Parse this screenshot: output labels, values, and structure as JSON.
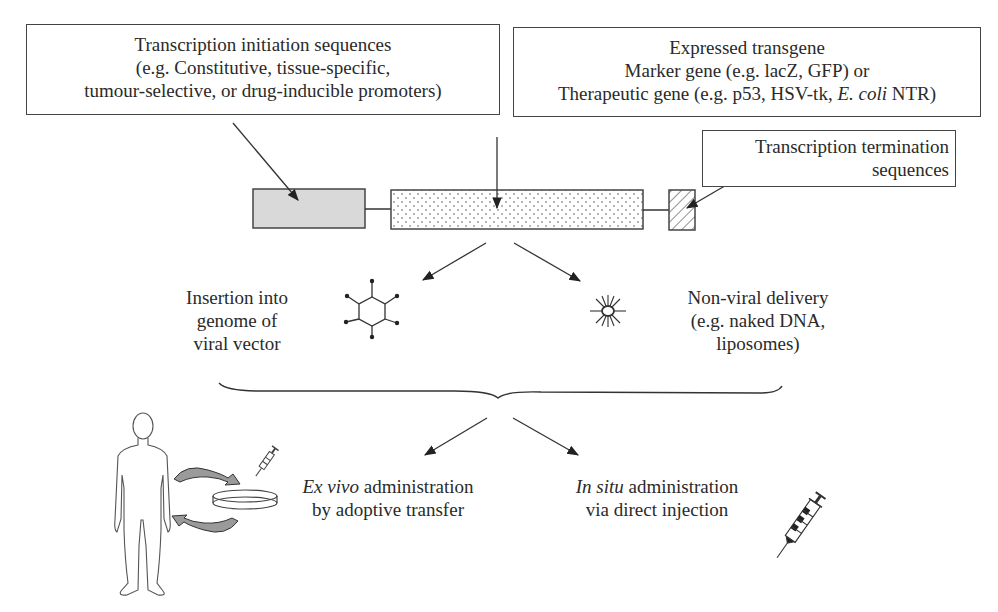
{
  "boxes": {
    "initiation": {
      "line1": "Transcription initiation sequences",
      "line2": "(e.g. Constitutive, tissue-specific,",
      "line3": "tumour-selective, or drug-inducible promoters)"
    },
    "transgene": {
      "line1": "Expressed transgene",
      "line2": "Marker gene (e.g. lacZ, GFP) or",
      "line3_pre": "Therapeutic gene (e.g. p53, HSV-tk, ",
      "line3_italic": "E. coli",
      "line3_post": " NTR)"
    },
    "termination": {
      "line1": "Transcription termination",
      "line2": "sequences"
    }
  },
  "delivery": {
    "viral": {
      "line1": "Insertion into",
      "line2": "genome of",
      "line3": "viral vector",
      "icon": "virus-hexagon-icon"
    },
    "nonviral": {
      "line1": "Non-viral delivery",
      "line2": "(e.g. naked DNA,",
      "line3": "liposomes)",
      "icon": "liposome-icon"
    }
  },
  "administration": {
    "ex_vivo": {
      "italic": "Ex vivo",
      "rest": " administration",
      "line2": "by adoptive transfer",
      "icons": [
        "human-figure-icon",
        "petri-dish-icon",
        "syringe-icon",
        "cycle-arrows-icon"
      ]
    },
    "in_situ": {
      "italic": "In situ",
      "rest": " administration",
      "line2": "via direct injection",
      "icons": [
        "syringe-icon"
      ]
    }
  },
  "colors": {
    "line": "#333333",
    "promoter_fill": "#d9d9d9",
    "arrow_fill": "#9a9a9a"
  }
}
